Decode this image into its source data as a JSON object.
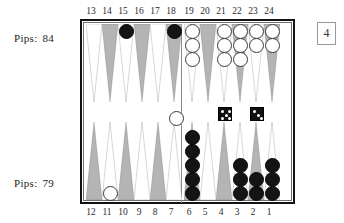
{
  "board": {
    "top_pips_label": "Pips:",
    "top_pips_value": "84",
    "bottom_pips_label": "Pips:",
    "bottom_pips_value": "79",
    "doubling_cube_value": "4",
    "top_point_numbers": [
      "13",
      "14",
      "15",
      "16",
      "17",
      "18",
      "19",
      "20",
      "21",
      "22",
      "23",
      "24"
    ],
    "bottom_point_numbers": [
      "12",
      "11",
      "10",
      "9",
      "8",
      "7",
      "6",
      "5",
      "4",
      "3",
      "2",
      "1"
    ],
    "colors": {
      "frame": "#121212",
      "inner_border": "#6e6e6e",
      "point_shaded": "#b4b4b4",
      "point_light": "#ffffff",
      "white_checker": "#ffffff",
      "black_checker": "#141414",
      "die_body": "#111111",
      "die_pip": "#ffffff",
      "background": "#ffffff"
    },
    "points": [
      {
        "number": "13",
        "quadrant": "top-left",
        "index": 0,
        "shade": "light",
        "checkers": 0,
        "color": "none"
      },
      {
        "number": "14",
        "quadrant": "top-left",
        "index": 1,
        "shade": "shaded",
        "checkers": 0,
        "color": "none"
      },
      {
        "number": "15",
        "quadrant": "top-left",
        "index": 2,
        "shade": "light",
        "checkers": 1,
        "color": "black"
      },
      {
        "number": "16",
        "quadrant": "top-left",
        "index": 3,
        "shade": "shaded",
        "checkers": 0,
        "color": "none"
      },
      {
        "number": "17",
        "quadrant": "top-left",
        "index": 4,
        "shade": "light",
        "checkers": 0,
        "color": "none"
      },
      {
        "number": "18",
        "quadrant": "top-left",
        "index": 5,
        "shade": "shaded",
        "checkers": 1,
        "color": "black"
      },
      {
        "number": "19",
        "quadrant": "top-right",
        "index": 6,
        "shade": "light",
        "checkers": 3,
        "color": "white"
      },
      {
        "number": "20",
        "quadrant": "top-right",
        "index": 7,
        "shade": "shaded",
        "checkers": 0,
        "color": "none"
      },
      {
        "number": "21",
        "quadrant": "top-right",
        "index": 8,
        "shade": "light",
        "checkers": 3,
        "color": "white"
      },
      {
        "number": "22",
        "quadrant": "top-right",
        "index": 9,
        "shade": "shaded",
        "checkers": 3,
        "color": "white"
      },
      {
        "number": "23",
        "quadrant": "top-right",
        "index": 10,
        "shade": "light",
        "checkers": 2,
        "color": "white"
      },
      {
        "number": "24",
        "quadrant": "top-right",
        "index": 11,
        "shade": "shaded",
        "checkers": 2,
        "color": "white"
      },
      {
        "number": "12",
        "quadrant": "bottom-left",
        "index": 0,
        "shade": "shaded",
        "checkers": 0,
        "color": "none"
      },
      {
        "number": "11",
        "quadrant": "bottom-left",
        "index": 1,
        "shade": "light",
        "checkers": 1,
        "color": "white"
      },
      {
        "number": "10",
        "quadrant": "bottom-left",
        "index": 2,
        "shade": "shaded",
        "checkers": 0,
        "color": "none"
      },
      {
        "number": "9",
        "quadrant": "bottom-left",
        "index": 3,
        "shade": "light",
        "checkers": 0,
        "color": "none"
      },
      {
        "number": "8",
        "quadrant": "bottom-left",
        "index": 4,
        "shade": "shaded",
        "checkers": 0,
        "color": "none"
      },
      {
        "number": "7",
        "quadrant": "bottom-left",
        "index": 5,
        "shade": "light",
        "checkers": 0,
        "color": "none"
      },
      {
        "number": "6",
        "quadrant": "bottom-right",
        "index": 6,
        "shade": "shaded",
        "checkers": 5,
        "color": "black"
      },
      {
        "number": "5",
        "quadrant": "bottom-right",
        "index": 7,
        "shade": "light",
        "checkers": 0,
        "color": "none"
      },
      {
        "number": "4",
        "quadrant": "bottom-right",
        "index": 8,
        "shade": "shaded",
        "checkers": 0,
        "color": "none"
      },
      {
        "number": "3",
        "quadrant": "bottom-right",
        "index": 9,
        "shade": "light",
        "checkers": 3,
        "color": "black"
      },
      {
        "number": "2",
        "quadrant": "bottom-right",
        "index": 10,
        "shade": "shaded",
        "checkers": 2,
        "color": "black"
      },
      {
        "number": "1",
        "quadrant": "bottom-right",
        "index": 11,
        "shade": "light",
        "checkers": 3,
        "color": "black"
      }
    ],
    "bar": {
      "white_checkers_on_bar": 1,
      "black_checkers_on_bar": 0
    },
    "dice": [
      {
        "value": 5,
        "name": "die-left"
      },
      {
        "value": 3,
        "name": "die-right"
      }
    ]
  }
}
